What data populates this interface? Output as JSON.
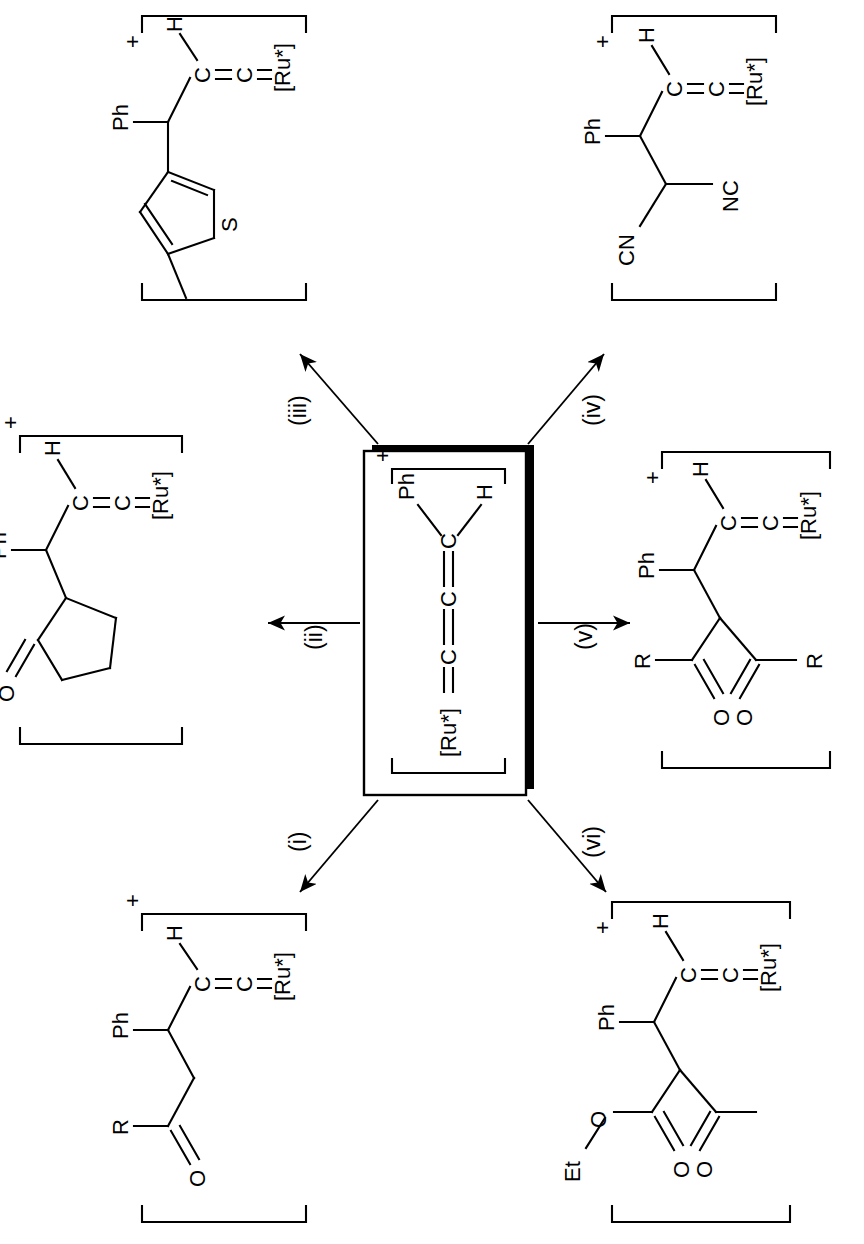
{
  "figure": {
    "kind": "reaction-scheme",
    "orientation": "rotated-90-ccw",
    "caption_fragment": "Scheme 1. [Ru*] = Ru(C5H5)(PPh3)2, reactions (i)-(vi) of the allenylidene cation.",
    "charge_symbol": "+"
  },
  "center": {
    "name": "allenylidene-cation",
    "charge": "+",
    "metal": "[Ru*]",
    "chain": [
      "C",
      "C",
      "C"
    ],
    "substituent_left": "Ph",
    "substituent_right": "H",
    "bond_label": "="
  },
  "arrows": [
    {
      "id": "i",
      "label": "(i)",
      "target": "product-i"
    },
    {
      "id": "ii",
      "label": "(ii)",
      "target": "product-ii"
    },
    {
      "id": "iii",
      "label": "(iii)",
      "target": "product-iii"
    },
    {
      "id": "iv",
      "label": "(iv)",
      "target": "product-iv"
    },
    {
      "id": "v",
      "label": "(v)",
      "target": "product-v"
    },
    {
      "id": "vi",
      "label": "(vi)",
      "target": "product-vi"
    }
  ],
  "products": [
    {
      "id": "product-i",
      "arrow": "(i)",
      "charge": "+",
      "description": "ketone enolate adduct",
      "labels": {
        "acyl_r": "R",
        "carbonyl_o": "O",
        "phenyl": "Ph",
        "vinylidene_c1": "C",
        "vinylidene_c2": "C",
        "hydrogen": "H",
        "metal": "[Ru*]"
      }
    },
    {
      "id": "product-ii",
      "arrow": "(ii)",
      "charge": "+",
      "description": "cyclopentanone adduct",
      "labels": {
        "carbonyl_o": "O",
        "phenyl": "Ph",
        "vinylidene_c1": "C",
        "vinylidene_c2": "C",
        "hydrogen": "H",
        "metal": "[Ru*]"
      }
    },
    {
      "id": "product-iii",
      "arrow": "(iii)",
      "charge": "+",
      "description": "2-methylthiophene adduct",
      "labels": {
        "sulfur": "S",
        "phenyl": "Ph",
        "vinylidene_c1": "C",
        "vinylidene_c2": "C",
        "hydrogen": "H",
        "metal": "[Ru*]"
      }
    },
    {
      "id": "product-iv",
      "arrow": "(iv)",
      "charge": "+",
      "description": "malononitrile adduct",
      "labels": {
        "nitrile_top": "CN",
        "nitrile_bottom": "NC",
        "phenyl": "Ph",
        "vinylidene_c1": "C",
        "vinylidene_c2": "C",
        "hydrogen": "H",
        "metal": "[Ru*]"
      }
    },
    {
      "id": "product-v",
      "arrow": "(v)",
      "charge": "+",
      "description": "1,3-diketone adduct",
      "labels": {
        "acyl_r_top": "R",
        "acyl_r_bottom": "R",
        "carbonyl_o_top": "O",
        "carbonyl_o_bottom": "O",
        "phenyl": "Ph",
        "vinylidene_c1": "C",
        "vinylidene_c2": "C",
        "hydrogen": "H",
        "metal": "[Ru*]"
      }
    },
    {
      "id": "product-vi",
      "arrow": "(vi)",
      "charge": "+",
      "description": "ethyl acetoacetate adduct",
      "labels": {
        "ethyl": "Et",
        "ester_o": "O",
        "carbonyl_o_top": "O",
        "carbonyl_o_bottom": "O",
        "phenyl": "Ph",
        "vinylidene_c1": "C",
        "vinylidene_c2": "C",
        "hydrogen": "H",
        "metal": "[Ru*]"
      }
    }
  ],
  "style": {
    "line": "#000000",
    "background": "#ffffff"
  }
}
